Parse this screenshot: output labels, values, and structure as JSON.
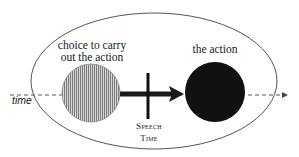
{
  "diagram": {
    "title": "",
    "labels": {
      "choice_line1": "choice to carry",
      "choice_line2": "out the action",
      "action": "the action",
      "speech_line1": "Speech",
      "speech_line2": "Time",
      "timeline": "time"
    },
    "nodes": [
      {
        "id": "choice",
        "label": "choice to carry out the action",
        "shape": "circle",
        "fill": "vertical-hatch",
        "color": "#9a9a9a"
      },
      {
        "id": "action",
        "label": "the action",
        "shape": "circle",
        "fill": "solid",
        "color": "#111111"
      }
    ],
    "edges": [
      {
        "from": "choice",
        "to": "action",
        "style": "thick-arrow",
        "color": "#1a1a1a"
      }
    ],
    "markers": [
      {
        "id": "speech-time",
        "label": "Speech Time",
        "style": "vertical-bar",
        "crosses_edge": "choice->action"
      }
    ],
    "timeline": {
      "label": "time",
      "style": "dashed-arrow",
      "direction": "left-to-right"
    },
    "container": {
      "shape": "ellipse",
      "stroke": "#555555"
    }
  }
}
